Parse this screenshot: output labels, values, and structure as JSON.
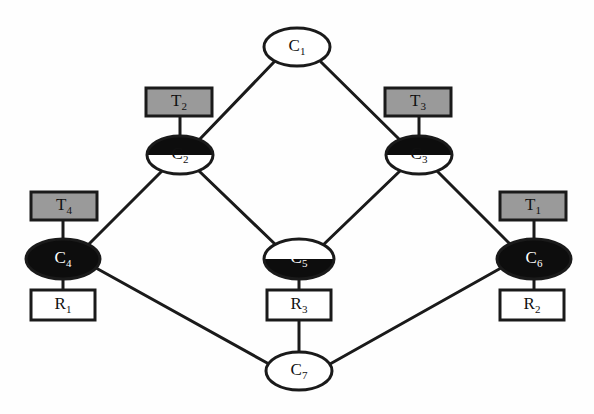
{
  "diagram": {
    "background_color": "#fefefe",
    "stroke_color": "#1a1a1a",
    "gray_fill": "#9a9a9a",
    "white_fill": "#ffffff",
    "black_fill": "#0d0d0d",
    "condition_nodes": [
      {
        "id": "C1",
        "base": "C",
        "sub": "1",
        "fill_style": "white",
        "label_color": "dark",
        "cx": 297,
        "cy": 47,
        "rx": 33,
        "ry": 19
      },
      {
        "id": "C2",
        "base": "C",
        "sub": "2",
        "fill_style": "half-top",
        "label_color": "dark",
        "cx": 180,
        "cy": 155,
        "rx": 33,
        "ry": 19
      },
      {
        "id": "C3",
        "base": "C",
        "sub": "3",
        "fill_style": "half-top",
        "label_color": "dark",
        "cx": 419,
        "cy": 155,
        "rx": 33,
        "ry": 19
      },
      {
        "id": "C4",
        "base": "C",
        "sub": "4",
        "fill_style": "black",
        "label_color": "light",
        "cx": 63,
        "cy": 259,
        "rx": 37,
        "ry": 20
      },
      {
        "id": "C5",
        "base": "C",
        "sub": "5",
        "fill_style": "half-bottom",
        "label_color": "light",
        "cx": 299,
        "cy": 259,
        "rx": 35,
        "ry": 20
      },
      {
        "id": "C6",
        "base": "C",
        "sub": "6",
        "fill_style": "black",
        "label_color": "light",
        "cx": 534,
        "cy": 259,
        "rx": 37,
        "ry": 20
      },
      {
        "id": "C7",
        "base": "C",
        "sub": "7",
        "fill_style": "white",
        "label_color": "dark",
        "cx": 299,
        "cy": 371,
        "rx": 33,
        "ry": 19
      }
    ],
    "transition_boxes": [
      {
        "id": "T2",
        "base": "T",
        "sub": "2",
        "fill_style": "gray",
        "label_color": "dark",
        "x": 146,
        "y": 88,
        "w": 66,
        "h": 28,
        "attaches_to": "C2"
      },
      {
        "id": "T3",
        "base": "T",
        "sub": "3",
        "fill_style": "gray",
        "label_color": "dark",
        "x": 385,
        "y": 88,
        "w": 66,
        "h": 28,
        "attaches_to": "C3"
      },
      {
        "id": "T4",
        "base": "T",
        "sub": "4",
        "fill_style": "gray",
        "label_color": "dark",
        "x": 31,
        "y": 192,
        "w": 66,
        "h": 28,
        "attaches_to": "C4"
      },
      {
        "id": "T1",
        "base": "T",
        "sub": "1",
        "fill_style": "gray",
        "label_color": "dark",
        "x": 500,
        "y": 192,
        "w": 66,
        "h": 28,
        "attaches_to": "C6"
      }
    ],
    "resource_boxes": [
      {
        "id": "R1",
        "base": "R",
        "sub": "1",
        "fill_style": "white",
        "label_color": "dark",
        "x": 31,
        "y": 290,
        "w": 64,
        "h": 30,
        "attaches_to": "C4"
      },
      {
        "id": "R3",
        "base": "R",
        "sub": "3",
        "fill_style": "white",
        "label_color": "dark",
        "x": 267,
        "y": 290,
        "w": 64,
        "h": 30,
        "attaches_to": "C5"
      },
      {
        "id": "R2",
        "base": "R",
        "sub": "2",
        "fill_style": "white",
        "label_color": "dark",
        "x": 500,
        "y": 290,
        "w": 64,
        "h": 30,
        "attaches_to": "C6"
      }
    ],
    "edges": [
      {
        "id": "e-c1-c2",
        "from": "C1",
        "to": "C2",
        "x1": 274,
        "y1": 62,
        "x2": 199,
        "y2": 140
      },
      {
        "id": "e-c1-c3",
        "from": "C1",
        "to": "C3",
        "x1": 321,
        "y1": 62,
        "x2": 400,
        "y2": 140
      },
      {
        "id": "e-c2-c4",
        "from": "C2",
        "to": "C4",
        "x1": 163,
        "y1": 170,
        "x2": 88,
        "y2": 245
      },
      {
        "id": "e-c2-c5",
        "from": "C2",
        "to": "C5",
        "x1": 198,
        "y1": 170,
        "x2": 277,
        "y2": 246
      },
      {
        "id": "e-c3-c5",
        "from": "C3",
        "to": "C5",
        "x1": 401,
        "y1": 170,
        "x2": 322,
        "y2": 246
      },
      {
        "id": "e-c3-c6",
        "from": "C3",
        "to": "C6",
        "x1": 436,
        "y1": 170,
        "x2": 511,
        "y2": 245
      },
      {
        "id": "e-c4-c7",
        "from": "C4",
        "to": "C7",
        "x1": 96,
        "y1": 268,
        "x2": 269,
        "y2": 364
      },
      {
        "id": "e-c6-c7",
        "from": "C6",
        "to": "C7",
        "x1": 501,
        "y1": 268,
        "x2": 330,
        "y2": 364
      },
      {
        "id": "e-c5-r3",
        "from": "C5",
        "to": "R3",
        "x1": 299,
        "y1": 277,
        "x2": 299,
        "y2": 290
      },
      {
        "id": "e-r3-c7",
        "from": "R3",
        "to": "C7",
        "x1": 299,
        "y1": 320,
        "x2": 299,
        "y2": 353
      },
      {
        "id": "e-t2-c2",
        "from": "T2",
        "to": "C2",
        "x1": 180,
        "y1": 116,
        "x2": 180,
        "y2": 138
      },
      {
        "id": "e-t3-c3",
        "from": "T3",
        "to": "C3",
        "x1": 419,
        "y1": 116,
        "x2": 419,
        "y2": 138
      },
      {
        "id": "e-t4-c4",
        "from": "T4",
        "to": "C4",
        "x1": 63,
        "y1": 220,
        "x2": 63,
        "y2": 241
      },
      {
        "id": "e-t1-c6",
        "from": "T1",
        "to": "C6",
        "x1": 534,
        "y1": 220,
        "x2": 534,
        "y2": 241
      },
      {
        "id": "e-c4-r1",
        "from": "C4",
        "to": "R1",
        "x1": 63,
        "y1": 278,
        "x2": 63,
        "y2": 290
      },
      {
        "id": "e-c6-r2",
        "from": "C6",
        "to": "R2",
        "x1": 534,
        "y1": 278,
        "x2": 534,
        "y2": 290
      }
    ]
  }
}
